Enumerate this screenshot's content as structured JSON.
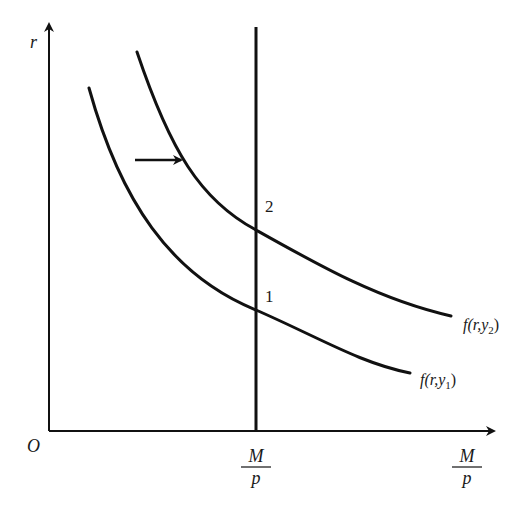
{
  "diagram": {
    "type": "money-market-equilibrium",
    "axes": {
      "y_label": "r",
      "origin_label": "O",
      "x_label_num": "M",
      "x_label_den": "p"
    },
    "supply_line": {
      "label_num": "M",
      "label_den": "p"
    },
    "curves": [
      {
        "id": "demand-y1",
        "label_prefix": "f(r,y",
        "label_sub": "1",
        "label_suffix": ")"
      },
      {
        "id": "demand-y2",
        "label_prefix": "f(r,y",
        "label_sub": "2",
        "label_suffix": ")"
      }
    ],
    "points": [
      {
        "label": "1"
      },
      {
        "label": "2"
      }
    ],
    "shift_arrow": "right",
    "colors": {
      "ink": "#111111",
      "background": "#ffffff"
    }
  }
}
